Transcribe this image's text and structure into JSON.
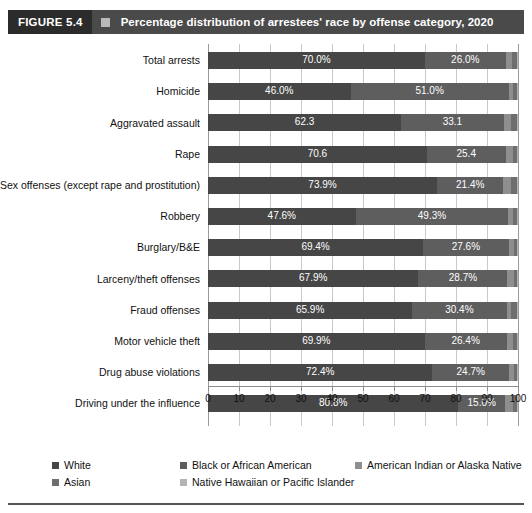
{
  "header": {
    "badge": "FIGURE 5.4",
    "marker_icon": "square-marker-icon",
    "title": "Percentage distribution of arrestees' race by offense category, 2020",
    "badge_bg": "#2b2b2b",
    "bar_bg": "#4a4a4a",
    "text_color": "#ffffff"
  },
  "chart_data": {
    "type": "bar",
    "orientation": "horizontal",
    "stacked": true,
    "title": "Percentage distribution of arrestees' race by offense category, 2020",
    "xlabel": "",
    "ylabel": "",
    "xlim": [
      0,
      100
    ],
    "xticks": [
      0,
      10,
      20,
      30,
      40,
      50,
      60,
      70,
      80,
      90,
      100
    ],
    "xtick_labels": [
      "0",
      "10",
      "20",
      "30",
      "40",
      "50",
      "60",
      "70",
      "80",
      "90",
      "100"
    ],
    "grid": true,
    "legend_position": "bottom",
    "categories": [
      "Total arrests",
      "Homicide",
      "Aggravated assault",
      "Rape",
      "Sex offenses (except rape and prostitution)",
      "Robbery",
      "Burglary/B&E",
      "Larceny/theft offenses",
      "Fraud offenses",
      "Motor vehicle theft",
      "Drug abuse violations",
      "Driving under the influence"
    ],
    "series": [
      {
        "name": "White",
        "color": "#464646",
        "values": [
          70.0,
          46.0,
          62.3,
          70.6,
          73.9,
          47.6,
          69.4,
          67.9,
          65.9,
          69.9,
          72.4,
          80.8
        ],
        "labels": [
          "70.0%",
          "46.0%",
          "62.3",
          "70.6",
          "73.9%",
          "47.6%",
          "69.4%",
          "67.9%",
          "65.9%",
          "69.9%",
          "72.4%",
          "80.8%"
        ]
      },
      {
        "name": "Black or African American",
        "color": "#5e5e5e",
        "values": [
          26.0,
          51.0,
          33.1,
          25.4,
          21.4,
          49.3,
          27.6,
          28.7,
          30.4,
          26.4,
          24.7,
          15.0
        ],
        "labels": [
          "26.0%",
          "51.0%",
          "33.1",
          "25.4",
          "21.4%",
          "49.3%",
          "27.6%",
          "28.7%",
          "30.4%",
          "26.4%",
          "24.7%",
          "15.0%"
        ]
      },
      {
        "name": "American Indian or Alaska Native",
        "color": "#8e8e8e",
        "values": [
          2.2,
          1.3,
          2.4,
          2.3,
          2.5,
          1.6,
          1.6,
          2.0,
          1.4,
          2.1,
          1.6,
          2.7
        ],
        "labels": [
          "",
          "",
          "",
          "",
          "",
          "",
          "",
          "",
          "",
          "",
          "",
          ""
        ]
      },
      {
        "name": "Asian",
        "color": "#6e6e6e",
        "values": [
          1.4,
          1.4,
          1.9,
          1.4,
          2.0,
          1.3,
          1.2,
          1.2,
          2.1,
          1.4,
          1.1,
          1.3
        ],
        "labels": [
          "",
          "",
          "",
          "",
          "",
          "",
          "",
          "",
          "",
          "",
          "",
          ""
        ]
      },
      {
        "name": "Native Hawaiian or Pacific Islander",
        "color": "#b4b4b4",
        "values": [
          0.4,
          0.3,
          0.3,
          0.3,
          0.2,
          0.2,
          0.2,
          0.2,
          0.2,
          0.2,
          0.2,
          0.2
        ],
        "labels": [
          "",
          "",
          "",
          "",
          "",
          "",
          "",
          "",
          "",
          "",
          "",
          ""
        ]
      }
    ]
  },
  "legend": {
    "items": [
      {
        "label": "White",
        "color": "#464646"
      },
      {
        "label": "Black or African American",
        "color": "#5e5e5e"
      },
      {
        "label": "American Indian or Alaska Native",
        "color": "#8e8e8e"
      },
      {
        "label": "Asian",
        "color": "#6e6e6e"
      },
      {
        "label": "Native Hawaiian or Pacific Islander",
        "color": "#b4b4b4"
      }
    ]
  }
}
